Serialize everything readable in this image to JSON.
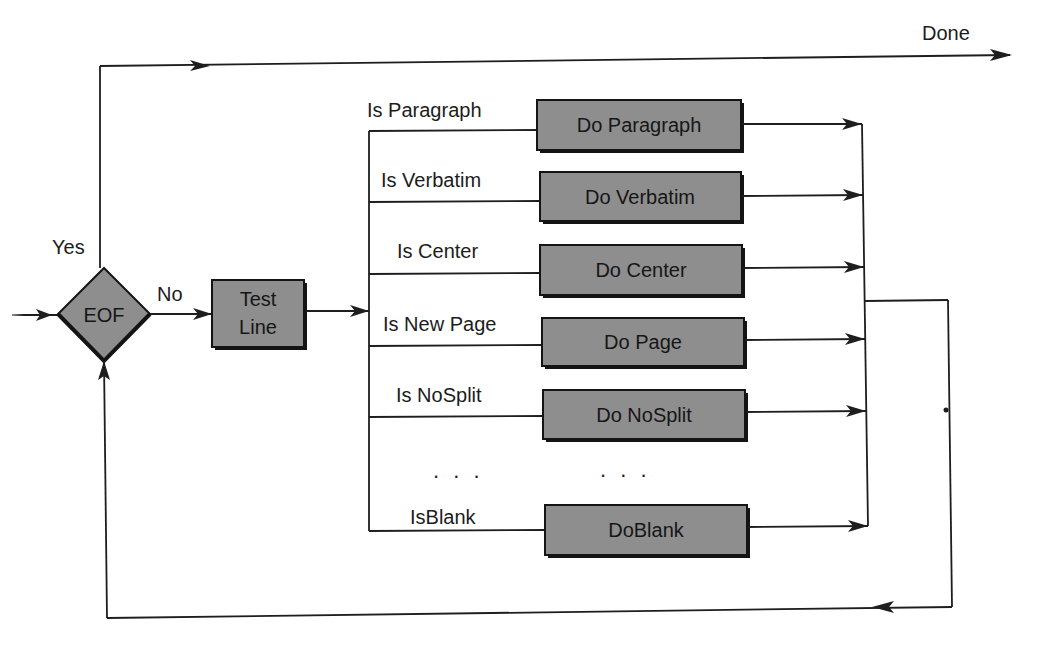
{
  "diagram": {
    "title": "",
    "colors": {
      "box_fill": "#8e8e8e",
      "line": "#1e1e1e",
      "background": "#ffffff"
    },
    "decision": {
      "label": "EOF",
      "yes_label": "Yes",
      "no_label": "No"
    },
    "test_box": {
      "line1": "Test",
      "line2": "Line"
    },
    "done_label": "Done",
    "branches": [
      {
        "condition": "Is Paragraph",
        "action": "Do Paragraph"
      },
      {
        "condition": "Is Verbatim",
        "action": "Do Verbatim"
      },
      {
        "condition": "Is Center",
        "action": "Do Center"
      },
      {
        "condition": "Is New Page",
        "action": "Do Page"
      },
      {
        "condition": "Is NoSplit",
        "action": "Do NoSplit"
      },
      {
        "condition": "IsBlank",
        "action": "DoBlank"
      }
    ],
    "ellipsis_condition": ". . .",
    "ellipsis_action": ". . ."
  }
}
